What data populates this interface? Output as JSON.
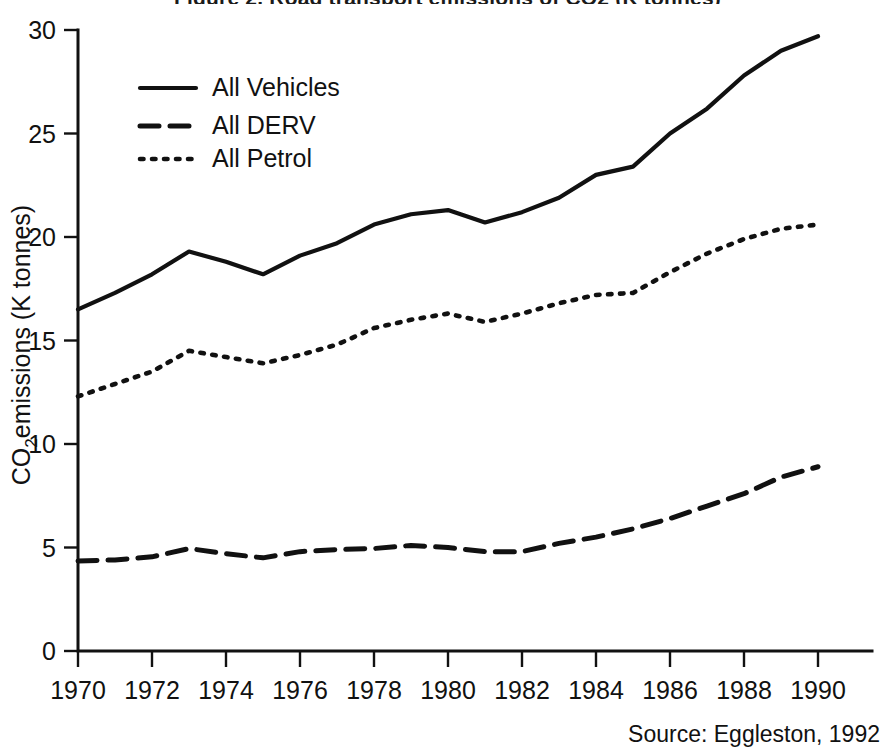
{
  "figure": {
    "title": "Figure 2. Road transport emissions of CO2 (K tonnes)",
    "title_visible_fragment": "2 (",
    "source_note": "Source: Eggleston, 1992",
    "background_color": "#ffffff",
    "ink_color": "#111111"
  },
  "axes": {
    "y_label_main": "CO",
    "y_label_sub": "2",
    "y_label_rest": "emissions (K tonnes)",
    "y_label_full": "CO2 emissions (K tonnes)",
    "x_label": ""
  },
  "legend": {
    "position": "upper-left-inside",
    "entries": [
      {
        "label": "All Vehicles",
        "style": "solid"
      },
      {
        "label": "All DERV",
        "style": "dashed"
      },
      {
        "label": "All Petrol",
        "style": "dotted"
      }
    ]
  },
  "chart_data": {
    "type": "line",
    "title": "Figure 2. Road transport emissions of CO2 (K tonnes)",
    "xlabel": "",
    "ylabel": "CO2 emissions (K tonnes)",
    "xlim": [
      1970,
      1990
    ],
    "ylim": [
      0,
      30
    ],
    "yticks": [
      0,
      5,
      10,
      15,
      20,
      25,
      30
    ],
    "xticks": [
      1970,
      1972,
      1974,
      1976,
      1978,
      1980,
      1982,
      1984,
      1986,
      1988,
      1990
    ],
    "x": [
      1970,
      1971,
      1972,
      1973,
      1974,
      1975,
      1976,
      1977,
      1978,
      1979,
      1980,
      1981,
      1982,
      1983,
      1984,
      1985,
      1986,
      1987,
      1988,
      1989,
      1990
    ],
    "grid": false,
    "legend_position": "upper left",
    "annotations": [
      "Source: Eggleston, 1992"
    ],
    "series": [
      {
        "name": "All Vehicles",
        "style": "solid",
        "values": [
          16.5,
          17.3,
          18.2,
          19.3,
          18.8,
          18.2,
          19.1,
          19.7,
          20.6,
          21.1,
          21.3,
          20.7,
          21.2,
          21.9,
          23.0,
          23.4,
          25.0,
          26.2,
          27.8,
          29.0,
          29.7
        ]
      },
      {
        "name": "All DERV",
        "style": "dashed",
        "values": [
          4.35,
          4.4,
          4.55,
          4.95,
          4.7,
          4.5,
          4.8,
          4.9,
          4.95,
          5.1,
          5.0,
          4.8,
          4.8,
          5.2,
          5.5,
          5.9,
          6.4,
          7.0,
          7.6,
          8.4,
          8.9
        ]
      },
      {
        "name": "All Petrol",
        "style": "dotted",
        "values": [
          12.3,
          12.9,
          13.5,
          14.5,
          14.2,
          13.9,
          14.3,
          14.8,
          15.6,
          16.0,
          16.3,
          15.9,
          16.3,
          16.8,
          17.2,
          17.3,
          18.3,
          19.2,
          19.9,
          20.4,
          20.6
        ]
      }
    ]
  }
}
